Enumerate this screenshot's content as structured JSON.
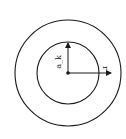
{
  "diagram": {
    "type": "concentric-circles",
    "center": {
      "x": 68,
      "y": 73
    },
    "outer_circle": {
      "radius": 53
    },
    "inner_circle": {
      "radius": 31
    },
    "stroke_color": "#1a1a1a",
    "labels": {
      "vertical_arrow": "a_k",
      "horizontal_arrow": "r"
    },
    "arrows": [
      {
        "name": "vertical-radius-arrow",
        "direction": "up",
        "to_boundary": "inner_circle",
        "label": "a_k"
      },
      {
        "name": "horizontal-radius-arrow",
        "direction": "right",
        "extends_past": "inner_circle",
        "label": "r"
      }
    ]
  }
}
